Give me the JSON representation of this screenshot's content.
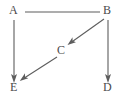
{
  "diagram": {
    "type": "directed-graph",
    "background_color": "#ffffff",
    "stroke_color": "#5d5d5d",
    "label_color": "#4a4a4a",
    "nodes": [
      {
        "id": "A",
        "label": "A",
        "x": 13,
        "y": 11
      },
      {
        "id": "B",
        "label": "B",
        "x": 107,
        "y": 11
      },
      {
        "id": "C",
        "label": "C",
        "x": 61,
        "y": 51
      },
      {
        "id": "D",
        "label": "D",
        "x": 108,
        "y": 88
      },
      {
        "id": "E",
        "label": "E",
        "x": 14,
        "y": 88
      }
    ],
    "edges": [
      {
        "id": "A-B",
        "from": "A",
        "to": "B",
        "directed": false,
        "x1": 25,
        "y1": 12,
        "x2": 100,
        "y2": 12
      },
      {
        "id": "A-E",
        "from": "A",
        "to": "E",
        "directed": true,
        "x1": 14,
        "y1": 20,
        "x2": 14,
        "y2": 81
      },
      {
        "id": "B-C",
        "from": "B",
        "to": "C",
        "directed": true,
        "x1": 104,
        "y1": 19,
        "x2": 69,
        "y2": 44
      },
      {
        "id": "B-D",
        "from": "B",
        "to": "D",
        "directed": true,
        "x1": 108,
        "y1": 20,
        "x2": 108,
        "y2": 81
      },
      {
        "id": "C-E",
        "from": "C",
        "to": "E",
        "directed": true,
        "x1": 57,
        "y1": 57,
        "x2": 21,
        "y2": 81
      }
    ]
  }
}
